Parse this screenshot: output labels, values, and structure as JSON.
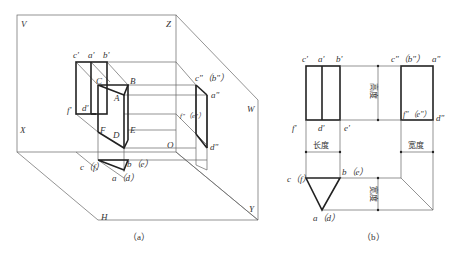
{
  "figure_a": {
    "caption": "（a）",
    "planes": {
      "V": "V",
      "H": "H",
      "W": "W"
    },
    "axes": {
      "X": "X",
      "Y": "Y",
      "Z": "Z",
      "O": "O"
    },
    "solid_vertices": {
      "A": "A",
      "B": "B",
      "C": "C",
      "D": "D",
      "E": "E",
      "F": "F"
    },
    "front_view_labels": {
      "c1": "c'",
      "a1": "a'",
      "b1": "b'",
      "f1": "f'",
      "d1": "d'"
    },
    "side_view_labels": {
      "cb": "c\"（b\"）",
      "a2": "a\"",
      "fe": "f\"（e\"）",
      "d2": "d\""
    },
    "top_view_labels": {
      "cf": "c（f）",
      "be": "b（e）",
      "ad": "a（d）"
    }
  },
  "figure_b": {
    "caption": "（b）",
    "front_view": {
      "c": "c'",
      "a": "a'",
      "b": "b'",
      "f": "f'",
      "d": "d'",
      "e": "e'"
    },
    "side_view": {
      "cb": "c\"（b\"）",
      "a": "a\"",
      "fe": "f\"（e\"）",
      "d": "d\""
    },
    "top_view": {
      "cf": "c（f）",
      "be": "b（e）",
      "ad": "a（d）"
    },
    "dimensions": {
      "height": "高度",
      "length": "长度",
      "width_right": "宽度",
      "width_bottom": "宽度"
    }
  }
}
